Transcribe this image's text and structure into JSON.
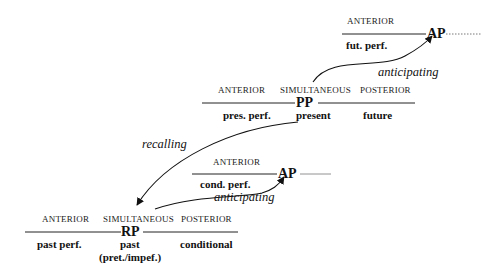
{
  "future_anterior_block": {
    "label_anterior": "ANTERIOR",
    "point": "AP",
    "tense_anterior": "fut. perf."
  },
  "present_block": {
    "label_anterior": "ANTERIOR",
    "label_simultaneous": "SIMULTANEOUS",
    "label_posterior": "POSTERIOR",
    "point": "PP",
    "tense_anterior": "pres. perf.",
    "tense_simultaneous": "present",
    "tense_posterior": "future"
  },
  "conditional_anterior_block": {
    "label_anterior": "ANTERIOR",
    "point": "AP",
    "tense_anterior": "cond. perf."
  },
  "past_block": {
    "label_anterior": "ANTERIOR",
    "label_simultaneous": "SIMULTANEOUS",
    "label_posterior": "POSTERIOR",
    "point": "RP",
    "tense_anterior": "past perf.",
    "tense_simultaneous": "past",
    "tense_simultaneous_sub": "(pret./impef.)",
    "tense_posterior": "conditional"
  },
  "arrows": {
    "present_to_future_ap": "anticipating",
    "present_to_past_rp": "recalling",
    "past_to_conditional_ap": "anticipating"
  }
}
